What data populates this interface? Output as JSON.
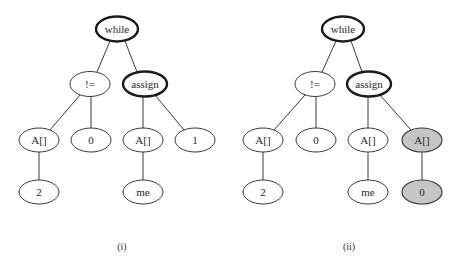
{
  "figure": {
    "panels": [
      {
        "caption": "(i)",
        "nodes": [
          {
            "id": "while",
            "label": "while"
          },
          {
            "id": "ne",
            "label": "!="
          },
          {
            "id": "assign",
            "label": "assign"
          },
          {
            "id": "a1",
            "label": "A[]"
          },
          {
            "id": "zero",
            "label": "0"
          },
          {
            "id": "a2",
            "label": "A[]"
          },
          {
            "id": "one",
            "label": "1"
          },
          {
            "id": "two",
            "label": "2"
          },
          {
            "id": "me",
            "label": "me"
          }
        ]
      },
      {
        "caption": "(ii)",
        "nodes": [
          {
            "id": "while",
            "label": "while"
          },
          {
            "id": "ne",
            "label": "!="
          },
          {
            "id": "assign",
            "label": "assign"
          },
          {
            "id": "a1",
            "label": "A[]"
          },
          {
            "id": "zero",
            "label": "0"
          },
          {
            "id": "a2",
            "label": "A[]"
          },
          {
            "id": "a3",
            "label": "A[]",
            "highlighted": true
          },
          {
            "id": "two",
            "label": "2"
          },
          {
            "id": "me",
            "label": "me"
          },
          {
            "id": "zero2",
            "label": "0",
            "highlighted": true
          }
        ]
      }
    ],
    "highlight_color": "#c6c6c6"
  }
}
